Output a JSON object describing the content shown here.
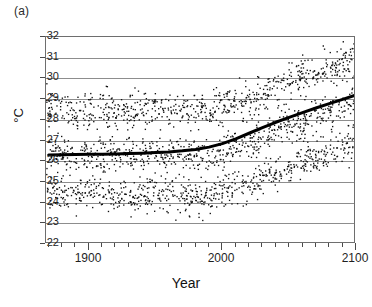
{
  "panel": {
    "label": "(a)"
  },
  "axes": {
    "x": {
      "title": "Year",
      "min": 1868,
      "max": 2100,
      "major_ticks": [
        1900,
        2000,
        2100
      ],
      "major_tick_labels": [
        "1900",
        "2000",
        "2100"
      ],
      "minor_tick_step": 10
    },
    "y": {
      "title": "°C",
      "min": 22,
      "max": 32,
      "ticks": [
        22,
        23,
        24,
        25,
        26,
        27,
        28,
        29,
        30,
        31,
        32
      ],
      "tick_labels": [
        "22",
        "23",
        "24",
        "25",
        "26",
        "27",
        "28",
        "29",
        "30",
        "31",
        "32"
      ]
    }
  },
  "style": {
    "frame_color": "#6e6e6e",
    "grid_color": "#8d8d8d",
    "point_color": "#111111",
    "trend_color": "#000000",
    "background": "#ffffff"
  },
  "chart_data": {
    "type": "scatter",
    "title": "",
    "xlabel": "Year",
    "ylabel": "°C",
    "xlim": [
      1868,
      2100
    ],
    "ylim": [
      22,
      32
    ],
    "grid": true,
    "legend": "none",
    "series": [
      {
        "name": "upper-band-scatter",
        "type": "scatter",
        "band_center_by_year": [
          {
            "x": 1870,
            "y": 28.55
          },
          {
            "x": 1900,
            "y": 28.5
          },
          {
            "x": 1930,
            "y": 28.5
          },
          {
            "x": 1960,
            "y": 28.5
          },
          {
            "x": 1980,
            "y": 28.45
          },
          {
            "x": 2000,
            "y": 28.7
          },
          {
            "x": 2020,
            "y": 29.1
          },
          {
            "x": 2040,
            "y": 29.6
          },
          {
            "x": 2060,
            "y": 30.1
          },
          {
            "x": 2080,
            "y": 30.6
          },
          {
            "x": 2100,
            "y": 31.0
          }
        ],
        "spread": 0.75,
        "n_points": 700
      },
      {
        "name": "middle-band-scatter",
        "type": "scatter",
        "band_center_by_year": [
          {
            "x": 1870,
            "y": 26.4
          },
          {
            "x": 1900,
            "y": 26.35
          },
          {
            "x": 1930,
            "y": 26.35
          },
          {
            "x": 1960,
            "y": 26.3
          },
          {
            "x": 1980,
            "y": 26.3
          },
          {
            "x": 2000,
            "y": 26.6
          },
          {
            "x": 2020,
            "y": 27.0
          },
          {
            "x": 2040,
            "y": 27.5
          },
          {
            "x": 2060,
            "y": 28.0
          },
          {
            "x": 2080,
            "y": 28.5
          },
          {
            "x": 2100,
            "y": 28.95
          }
        ],
        "spread": 0.7,
        "n_points": 700
      },
      {
        "name": "lower-band-scatter",
        "type": "scatter",
        "band_center_by_year": [
          {
            "x": 1870,
            "y": 24.6
          },
          {
            "x": 1900,
            "y": 24.5
          },
          {
            "x": 1930,
            "y": 24.45
          },
          {
            "x": 1960,
            "y": 24.35
          },
          {
            "x": 1980,
            "y": 24.3
          },
          {
            "x": 2000,
            "y": 24.6
          },
          {
            "x": 2020,
            "y": 25.0
          },
          {
            "x": 2040,
            "y": 25.5
          },
          {
            "x": 2060,
            "y": 26.0
          },
          {
            "x": 2080,
            "y": 26.5
          },
          {
            "x": 2100,
            "y": 26.95
          }
        ],
        "spread": 0.72,
        "n_points": 700
      },
      {
        "name": "smoothed-trend-line",
        "type": "line",
        "linewidth": 3,
        "points": [
          {
            "x": 1870,
            "y": 26.3
          },
          {
            "x": 1880,
            "y": 26.31
          },
          {
            "x": 1890,
            "y": 26.32
          },
          {
            "x": 1900,
            "y": 26.33
          },
          {
            "x": 1910,
            "y": 26.34
          },
          {
            "x": 1920,
            "y": 26.35
          },
          {
            "x": 1930,
            "y": 26.37
          },
          {
            "x": 1940,
            "y": 26.39
          },
          {
            "x": 1950,
            "y": 26.42
          },
          {
            "x": 1960,
            "y": 26.45
          },
          {
            "x": 1970,
            "y": 26.5
          },
          {
            "x": 1980,
            "y": 26.57
          },
          {
            "x": 1990,
            "y": 26.68
          },
          {
            "x": 2000,
            "y": 26.85
          },
          {
            "x": 2010,
            "y": 27.08
          },
          {
            "x": 2020,
            "y": 27.35
          },
          {
            "x": 2030,
            "y": 27.62
          },
          {
            "x": 2040,
            "y": 27.88
          },
          {
            "x": 2050,
            "y": 28.12
          },
          {
            "x": 2060,
            "y": 28.35
          },
          {
            "x": 2070,
            "y": 28.57
          },
          {
            "x": 2080,
            "y": 28.78
          },
          {
            "x": 2090,
            "y": 28.99
          },
          {
            "x": 2100,
            "y": 29.2
          }
        ]
      }
    ],
    "outliers": [
      {
        "x": 1975,
        "y": 23.35
      },
      {
        "x": 1968,
        "y": 23.55
      },
      {
        "x": 1982,
        "y": 23.5
      },
      {
        "x": 1958,
        "y": 23.6
      },
      {
        "x": 2090,
        "y": 31.8
      },
      {
        "x": 2075,
        "y": 31.6
      },
      {
        "x": 2098,
        "y": 31.7
      }
    ]
  }
}
